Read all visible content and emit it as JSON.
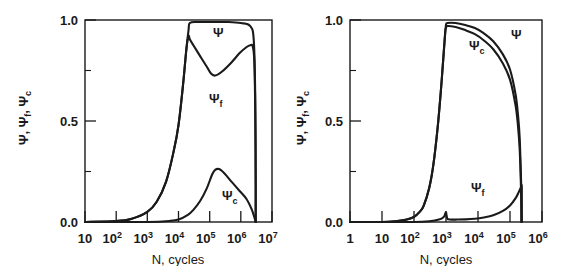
{
  "figure": {
    "panels": [
      {
        "id": "left-panel",
        "xlabel": "N, cycles",
        "ylabel": "Ψ, Ψ , Ψ",
        "ylabel_parts": [
          "Ψ",
          "Ψ",
          "f",
          "Ψ",
          "c"
        ],
        "yticks": [
          "1.0",
          "0.5",
          "0.0"
        ],
        "xticks": [
          "10",
          "10",
          "10",
          "10",
          "10",
          "10",
          "10"
        ],
        "xtick_exponents": [
          "",
          "2",
          "3",
          "4",
          "5",
          "6",
          "7"
        ],
        "curve_labels": [
          {
            "name": "psi-label",
            "base": "Ψ",
            "sub": ""
          },
          {
            "name": "psi-f-label",
            "base": "Ψ",
            "sub": "f"
          },
          {
            "name": "psi-c-label",
            "base": "Ψ",
            "sub": "c"
          }
        ]
      },
      {
        "id": "right-panel",
        "xlabel": "N, cycles",
        "ylabel": "Ψ, Ψ , Ψ",
        "ylabel_parts": [
          "Ψ",
          "Ψ",
          "f",
          "Ψ",
          "c"
        ],
        "yticks": [
          "1.0",
          "0.5",
          "0.0"
        ],
        "xticks": [
          "1",
          "10",
          "10",
          "10",
          "10",
          "10",
          "10"
        ],
        "xtick_exponents": [
          "",
          "",
          "2",
          "3",
          "4",
          "5",
          "6"
        ],
        "curve_labels": [
          {
            "name": "psi-label",
            "base": "Ψ",
            "sub": ""
          },
          {
            "name": "psi-c-label",
            "base": "Ψ",
            "sub": "c"
          },
          {
            "name": "psi-f-label",
            "base": "Ψ",
            "sub": "f"
          }
        ]
      }
    ]
  },
  "chart_data": [
    {
      "type": "line",
      "panel": "left",
      "title": "",
      "xlabel": "N, cycles",
      "ylabel": "Ψ, Ψ_f, Ψ_c",
      "xscale": "log",
      "xlim": [
        10,
        10000000
      ],
      "ylim": [
        0.0,
        1.0
      ],
      "xtick_labels": [
        "10",
        "10^2",
        "10^3",
        "10^4",
        "10^5",
        "10^6",
        "10^7"
      ],
      "ytick_labels": [
        "0.0",
        "0.5",
        "1.0"
      ],
      "grid": false,
      "legend": "inline-annotations",
      "series": [
        {
          "name": "Ψ",
          "x": [
            10,
            100,
            300,
            1000,
            2000,
            4000,
            7000,
            10000,
            14000,
            18000,
            21000,
            23000,
            40000,
            100000,
            400000,
            1000000,
            2000000,
            2600000,
            2900000,
            3000000,
            3000000
          ],
          "y": [
            0.0,
            0.005,
            0.015,
            0.05,
            0.1,
            0.2,
            0.35,
            0.48,
            0.68,
            0.86,
            0.95,
            0.985,
            0.99,
            0.99,
            0.99,
            0.985,
            0.97,
            0.9,
            0.62,
            0.2,
            0.0
          ]
        },
        {
          "name": "Ψ_f",
          "x": [
            10,
            100,
            300,
            1000,
            2000,
            4000,
            7000,
            10000,
            14000,
            18000,
            21000,
            23000,
            30000,
            50000,
            80000,
            110000,
            150000,
            250000,
            500000,
            900000,
            1500000,
            2000000,
            2400000,
            2700000,
            2900000,
            3000000,
            3000000
          ],
          "y": [
            0.0,
            0.005,
            0.015,
            0.05,
            0.1,
            0.2,
            0.35,
            0.48,
            0.68,
            0.86,
            0.92,
            0.905,
            0.875,
            0.82,
            0.77,
            0.735,
            0.725,
            0.745,
            0.79,
            0.835,
            0.865,
            0.875,
            0.87,
            0.8,
            0.55,
            0.18,
            0.0
          ]
        },
        {
          "name": "Ψ_c",
          "x": [
            10,
            100,
            1000,
            5000,
            10000,
            20000,
            30000,
            50000,
            80000,
            120000,
            150000,
            200000,
            300000,
            500000,
            900000,
            1500000,
            2200000,
            2700000,
            3000000
          ],
          "y": [
            0.0,
            0.0,
            0.0,
            0.005,
            0.012,
            0.035,
            0.06,
            0.105,
            0.165,
            0.235,
            0.258,
            0.262,
            0.24,
            0.2,
            0.155,
            0.115,
            0.065,
            0.025,
            0.0
          ]
        }
      ]
    },
    {
      "type": "line",
      "panel": "right",
      "title": "",
      "xlabel": "N, cycles",
      "ylabel": "Ψ, Ψ_f, Ψ_c",
      "xscale": "log",
      "xlim": [
        1,
        1000000
      ],
      "ylim": [
        0.0,
        1.0
      ],
      "xtick_labels": [
        "1",
        "10",
        "10^2",
        "10^3",
        "10^4",
        "10^5",
        "10^6"
      ],
      "ytick_labels": [
        "0.0",
        "0.5",
        "1.0"
      ],
      "grid": false,
      "legend": "inline-annotations",
      "series": [
        {
          "name": "Ψ",
          "x": [
            1,
            10,
            30,
            60,
            100,
            150,
            200,
            300,
            400,
            550,
            700,
            850,
            950,
            1000,
            1100,
            2000,
            4000,
            8000,
            15000,
            30000,
            60000,
            100000,
            150000,
            180000,
            200000,
            215000,
            225000,
            230000,
            230000
          ],
          "y": [
            0.0,
            0.0,
            0.005,
            0.012,
            0.025,
            0.05,
            0.08,
            0.17,
            0.28,
            0.47,
            0.66,
            0.84,
            0.94,
            0.975,
            0.985,
            0.985,
            0.975,
            0.96,
            0.935,
            0.895,
            0.83,
            0.755,
            0.63,
            0.52,
            0.42,
            0.28,
            0.17,
            0.17,
            0.0
          ]
        },
        {
          "name": "Ψ_c",
          "x": [
            1,
            10,
            30,
            60,
            100,
            150,
            200,
            300,
            400,
            550,
            700,
            850,
            950,
            1000,
            1100,
            2000,
            4000,
            8000,
            15000,
            30000,
            60000,
            100000,
            150000,
            180000,
            200000,
            215000,
            225000,
            230000,
            230000
          ],
          "y": [
            0.0,
            0.0,
            0.005,
            0.012,
            0.025,
            0.05,
            0.08,
            0.17,
            0.28,
            0.47,
            0.66,
            0.84,
            0.945,
            0.96,
            0.97,
            0.965,
            0.95,
            0.93,
            0.9,
            0.855,
            0.785,
            0.705,
            0.575,
            0.465,
            0.365,
            0.23,
            0.1,
            0.02,
            0.0
          ]
        },
        {
          "name": "Ψ_f",
          "x": [
            1,
            10,
            100,
            300,
            600,
            850,
            950,
            1000,
            1050,
            1100,
            1300,
            2000,
            4000,
            8000,
            15000,
            30000,
            60000,
            100000,
            150000,
            190000,
            215000,
            225000,
            230000,
            230000
          ],
          "y": [
            0.0,
            0.0,
            0.0,
            0.004,
            0.012,
            0.025,
            0.042,
            0.048,
            0.03,
            0.016,
            0.012,
            0.012,
            0.013,
            0.016,
            0.022,
            0.033,
            0.055,
            0.082,
            0.118,
            0.15,
            0.168,
            0.172,
            0.172,
            0.0
          ]
        }
      ]
    }
  ]
}
